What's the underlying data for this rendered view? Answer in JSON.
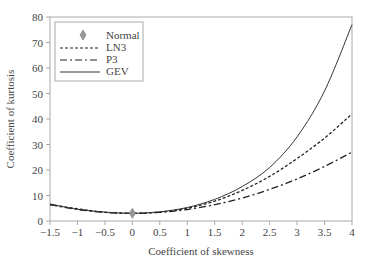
{
  "chart_data": {
    "type": "line",
    "title": "",
    "xlabel": "Coefficient of skewness",
    "ylabel": "Coefficient of kurtosis",
    "xlim": [
      -1.5,
      4
    ],
    "ylim": [
      0,
      80
    ],
    "x_ticks": [
      "-1.5",
      "-1",
      "-0.5",
      "0",
      "0.5",
      "1",
      "1.5",
      "2",
      "2.5",
      "3",
      "3.5",
      "4"
    ],
    "y_ticks": [
      "0",
      "10",
      "20",
      "30",
      "40",
      "50",
      "60",
      "70",
      "80"
    ],
    "grid": false,
    "legend_position": "upper-left",
    "legend": [
      "Normal",
      "LN3",
      "P3",
      "GEV"
    ],
    "x": [
      -1.5,
      -1,
      -0.5,
      0,
      0.5,
      1,
      1.5,
      2,
      2.5,
      3,
      3.5,
      4
    ],
    "series": [
      {
        "name": "Normal",
        "style": "diamond-marker",
        "points": [
          [
            0,
            3
          ]
        ]
      },
      {
        "name": "LN3",
        "style": "dashed",
        "values": [
          6.4,
          4.8,
          3.4,
          3.0,
          3.5,
          5.0,
          7.8,
          12.0,
          17.5,
          24.5,
          32.5,
          42.0
        ]
      },
      {
        "name": "P3",
        "style": "dash-dot",
        "values": [
          6.4,
          4.5,
          3.4,
          3.0,
          3.4,
          4.5,
          6.4,
          9.0,
          12.4,
          16.5,
          21.4,
          27.0
        ]
      },
      {
        "name": "GEV",
        "style": "solid",
        "values": [
          6.7,
          4.6,
          3.5,
          3.0,
          3.6,
          5.3,
          8.5,
          13.5,
          21.0,
          33.0,
          51.0,
          77.0
        ]
      }
    ]
  }
}
